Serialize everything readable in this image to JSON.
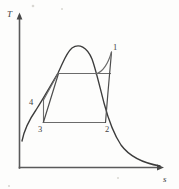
{
  "figure": {
    "kind": "thermodynamic-T-s-diagram",
    "background_color": "#fdfdfc",
    "line_color": "#3c3c3c",
    "cycle_color": "#6b6b6b"
  },
  "axes": {
    "y_label": "T",
    "x_label": "s",
    "y_axis": {
      "x": 19,
      "y_top": 14,
      "y_bottom": 168
    },
    "x_axis": {
      "y": 168,
      "x_left": 19,
      "x_right": 163
    },
    "arrowheads": true,
    "ticks": false,
    "gridlines": false
  },
  "state_points": [
    {
      "id": "1",
      "label": "1",
      "label_x": 113,
      "label_y": 48,
      "point_x": 111,
      "point_y": 53
    },
    {
      "id": "2",
      "label": "2",
      "label_x": 107,
      "label_y": 131,
      "point_x": 105,
      "point_y": 122
    },
    {
      "id": "3",
      "label": "3",
      "label_x": 40,
      "label_y": 131,
      "point_x": 43,
      "point_y": 122
    },
    {
      "id": "4",
      "label": "4",
      "label_x": 30,
      "label_y": 104,
      "point_x": 43,
      "point_y": 100
    }
  ],
  "curves": {
    "saturation_dome": "vapor dome: rises from lower-left, peaks at critical point, falls to asymptotic right tail",
    "critical_point": {
      "x": 72,
      "y": 47
    },
    "left_foot": {
      "x": 22,
      "y": 141
    },
    "right_tail_end": {
      "x": 160,
      "y": 166
    }
  },
  "process_lines": [
    {
      "from": "3",
      "to": "4",
      "type": "pump-compression",
      "description": "short vertical rise at left"
    },
    {
      "from": "4",
      "to": "1",
      "type": "heat-addition",
      "description": "line up-right to turbine inlet"
    },
    {
      "from": "1",
      "to": "2",
      "type": "turbine-expansion",
      "description": "near-vertical drop at right"
    },
    {
      "from": "2",
      "to": "3",
      "type": "condensation",
      "description": "horizontal line at constant temperature"
    },
    {
      "from": "3",
      "to": "top",
      "type": "saturated-liquid-heating",
      "description": "line from 3 up to upper horizontal"
    },
    {
      "from": "top-left",
      "to": "top-right",
      "type": "boiling-isotherm",
      "description": "upper horizontal line inside dome"
    }
  ],
  "specks": [
    {
      "x": 33,
      "y": 6
    },
    {
      "x": 62,
      "y": 9
    },
    {
      "x": 118,
      "y": 178
    },
    {
      "x": 9,
      "y": 186
    }
  ]
}
